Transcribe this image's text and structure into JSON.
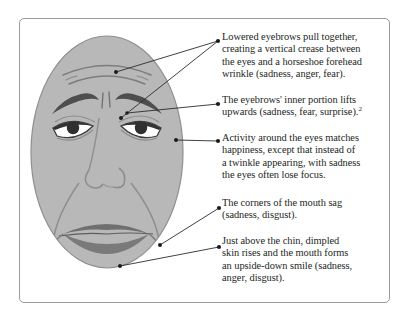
{
  "figure": {
    "frame_color": "#9a9a9a",
    "face_fill": "#b8b8b8",
    "face_outline": "#6e6e6e",
    "feature_dark": "#5a5a5a",
    "lip_fill": "#7a7a7a",
    "leader_line_color": "#2b2b2b",
    "text_color": "#231f1c"
  },
  "callouts": [
    {
      "id": "callout-eyebrows-lowered",
      "anchor": "forehead-and-glabella",
      "lines": [
        "Lowered eyebrows pull together,",
        "creating a vertical crease between",
        "the eyes and a horseshoe forehead",
        "wrinkle (sadness, anger, fear)."
      ]
    },
    {
      "id": "callout-eyebrow-inner-lift",
      "anchor": "inner-eyebrow",
      "lines": [
        "The eyebrows' inner portion lifts",
        "upwards (sadness, fear, surprise)."
      ],
      "footnote": "2"
    },
    {
      "id": "callout-eye-activity",
      "anchor": "outer-eye-corner",
      "lines": [
        "Activity around the eyes matches",
        "happiness, except that instead of",
        "a twinkle appearing, with sadness",
        "the eyes often lose focus."
      ]
    },
    {
      "id": "callout-mouth-corners",
      "anchor": "mouth-corner",
      "lines": [
        "The corners of the mouth sag",
        "(sadness, disgust)."
      ]
    },
    {
      "id": "callout-chin-dimple",
      "anchor": "chin-dimple",
      "lines": [
        "Just above the chin, dimpled",
        "skin rises and the mouth forms",
        "an upside-down smile (sadness,",
        "anger, disgust)."
      ]
    }
  ]
}
